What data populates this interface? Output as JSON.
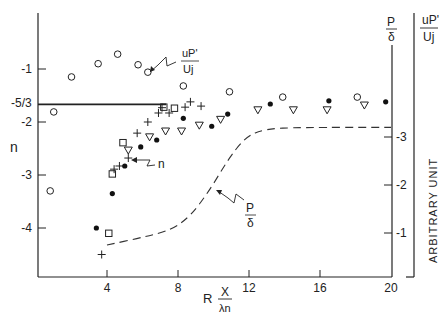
{
  "chart_data": {
    "type": "scatter",
    "title": "",
    "xlabel": "R",
    "xlabel_fraction": {
      "numerator": "X",
      "denominator": "λn"
    },
    "x_ticks": [
      "4",
      "8",
      "12",
      "16",
      "20"
    ],
    "x_tick_values": [
      4,
      8,
      12,
      16,
      20
    ],
    "xlim": [
      0,
      20
    ],
    "left_axis": {
      "label": "n",
      "ticks": [
        "-1",
        "-2",
        "-3",
        "-4"
      ],
      "tick_values": [
        -1,
        -2,
        -3,
        -4
      ],
      "reference_line": {
        "label": "-5/3",
        "value": -1.6667
      },
      "ylim": [
        -5.0,
        -0.3
      ]
    },
    "right_axis_inner": {
      "label_numerator": "P",
      "label_denominator": "δ",
      "ticks": [
        "1",
        "2",
        "3"
      ],
      "tick_values": [
        1,
        2,
        3
      ]
    },
    "right_axis_outer": {
      "label_numerator": "uP'",
      "label_denominator": "Uj",
      "caption": "ARBITRARY UNIT"
    },
    "annotations": [
      {
        "text_num": "uP'",
        "text_den": "Uj",
        "points_to": "open-circle series"
      },
      {
        "text": "n",
        "points_to": "n data"
      },
      {
        "text_num": "P",
        "text_den": "δ",
        "points_to": "dashed curve"
      }
    ],
    "series": [
      {
        "name": "uP'/Uj (open circles)",
        "marker": "open-circle",
        "points": [
          [
            0.8,
            -3.3
          ],
          [
            1.0,
            -1.81
          ],
          [
            2.0,
            -1.15
          ],
          [
            3.5,
            -0.9
          ],
          [
            4.6,
            -0.72
          ],
          [
            5.75,
            -0.92
          ],
          [
            6.3,
            -1.06
          ],
          [
            8.3,
            -1.32
          ],
          [
            10.9,
            -1.43
          ],
          [
            13.9,
            -1.53
          ],
          [
            18.1,
            -1.53
          ]
        ]
      },
      {
        "name": "n (filled circles)",
        "marker": "filled-circle",
        "points": [
          [
            3.4,
            -4.0
          ],
          [
            4.3,
            -3.35
          ],
          [
            5.0,
            -2.83
          ],
          [
            5.9,
            -2.47
          ],
          [
            6.8,
            -2.34
          ],
          [
            8.3,
            -1.93
          ],
          [
            10.8,
            -1.85
          ],
          [
            9.9,
            -2.08
          ],
          [
            13.2,
            -1.66
          ],
          [
            16.5,
            -1.6
          ],
          [
            19.7,
            -1.62
          ]
        ]
      },
      {
        "name": "n (squares)",
        "marker": "square",
        "points": [
          [
            4.3,
            -2.98
          ],
          [
            4.9,
            -2.39
          ],
          [
            4.1,
            -4.1
          ],
          [
            7.2,
            -1.72
          ],
          [
            7.8,
            -1.74
          ]
        ]
      },
      {
        "name": "n (plus)",
        "marker": "plus",
        "points": [
          [
            3.7,
            -4.5
          ],
          [
            4.4,
            -2.89
          ],
          [
            4.7,
            -2.83
          ],
          [
            5.2,
            -2.68
          ],
          [
            5.7,
            -2.21
          ],
          [
            6.9,
            -1.83
          ],
          [
            7.1,
            -1.73
          ],
          [
            8.7,
            -1.62
          ],
          [
            9.3,
            -1.7
          ],
          [
            6.3,
            -2.0
          ],
          [
            7.5,
            -1.83
          ],
          [
            8.4,
            -1.72
          ]
        ]
      },
      {
        "name": "n (open triangles)",
        "marker": "triangle-down",
        "points": [
          [
            5.2,
            -2.53
          ],
          [
            6.4,
            -2.28
          ],
          [
            7.3,
            -2.17
          ],
          [
            8.2,
            -2.17
          ],
          [
            9.2,
            -2.06
          ],
          [
            10.4,
            -1.95
          ],
          [
            12.5,
            -1.77
          ],
          [
            14.5,
            -1.77
          ],
          [
            16.4,
            -1.77
          ],
          [
            18.5,
            -1.68
          ]
        ]
      },
      {
        "name": "P/δ (dashed)",
        "marker": "dashed-line",
        "axis": "right_axis_inner",
        "points": [
          [
            4.0,
            0.75
          ],
          [
            5.9,
            0.9
          ],
          [
            7.6,
            1.06
          ],
          [
            8.7,
            1.35
          ],
          [
            9.8,
            1.9
          ],
          [
            10.8,
            2.52
          ],
          [
            11.8,
            3.0
          ],
          [
            12.9,
            3.17
          ],
          [
            14.9,
            3.2
          ],
          [
            20.0,
            3.2
          ]
        ]
      }
    ],
    "grid": false,
    "legend": "none"
  }
}
